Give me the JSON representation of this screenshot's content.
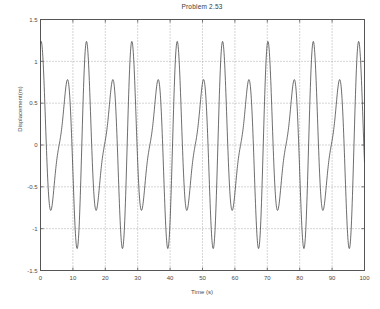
{
  "chart_data": {
    "type": "line",
    "title": "Problem 2.53",
    "xlabel": "Time (s)",
    "ylabel": "Displacement(m)",
    "xlim": [
      0,
      100
    ],
    "ylim": [
      -1.5,
      1.5
    ],
    "xticks": [
      0,
      10,
      20,
      30,
      40,
      50,
      60,
      70,
      80,
      90,
      100
    ],
    "xtick_labels": [
      "0",
      "10",
      "20",
      "30",
      "40",
      "50",
      "60",
      "70",
      "80",
      "90",
      "100"
    ],
    "yticks": [
      -1.5,
      -1,
      -0.5,
      0,
      0.5,
      1,
      1.5
    ],
    "ytick_labels": [
      "-1.5",
      "-1",
      "-0.5",
      "0",
      "0.5",
      "1",
      "1.5"
    ],
    "grid": true,
    "grid_style": "dotted",
    "line_color": "#3c3c3c",
    "background_color": "#ffffff",
    "legend": null,
    "series": [
      {
        "name": "Displacement",
        "model": "x(t) = A1*sin(w1*t) + A2*sin(w2*t)",
        "amplitude_envelope_max": 1.3,
        "amplitude_envelope_min": 0.45,
        "beat_period": 28,
        "carrier_period": 7.0,
        "x": [
          0,
          0.5,
          1,
          1.5,
          2,
          2.5,
          3,
          3.5,
          4,
          4.5,
          5,
          5.5,
          6,
          6.5,
          7,
          7.5,
          8,
          8.5,
          9,
          9.5,
          10,
          10.5,
          11,
          11.5,
          12,
          12.5,
          13,
          13.5,
          14,
          14.5,
          15,
          15.5,
          16,
          16.5,
          17,
          17.5,
          18,
          18.5,
          19,
          19.5,
          20,
          20.5,
          21,
          21.5,
          22,
          22.5,
          23,
          23.5,
          24,
          24.5,
          25,
          25.5,
          26,
          26.5,
          27,
          27.5,
          28,
          28.5,
          29,
          29.5,
          30,
          30.5,
          31,
          31.5,
          32,
          32.5,
          33,
          33.5,
          34,
          34.5,
          35,
          35.5,
          36,
          36.5,
          37,
          37.5,
          38,
          38.5,
          39,
          39.5,
          40,
          40.5,
          41,
          41.5,
          42,
          42.5,
          43,
          43.5,
          44,
          44.5,
          45,
          45.5,
          46,
          46.5,
          47,
          47.5,
          48,
          48.5,
          49,
          49.5,
          50,
          50.5,
          51,
          51.5,
          52,
          52.5,
          53,
          53.5,
          54,
          54.5,
          55,
          55.5,
          56,
          56.5,
          57,
          57.5,
          58,
          58.5,
          59,
          59.5,
          60,
          60.5,
          61,
          61.5,
          62,
          62.5,
          63,
          63.5,
          64,
          64.5,
          65,
          65.5,
          66,
          66.5,
          67,
          67.5,
          68,
          68.5,
          69,
          69.5,
          70,
          70.5,
          71,
          71.5,
          72,
          72.5,
          73,
          73.5,
          74,
          74.5,
          75,
          75.5,
          76,
          76.5,
          77,
          77.5,
          78,
          78.5,
          79,
          79.5,
          80,
          80.5,
          81,
          81.5,
          82,
          82.5,
          83,
          83.5,
          84,
          84.5,
          85,
          85.5,
          86,
          86.5,
          87,
          87.5,
          88,
          88.5,
          89,
          89.5,
          90,
          90.5,
          91,
          91.5,
          92,
          92.5,
          93,
          93.5,
          94,
          94.5,
          95,
          95.5,
          96,
          96.5,
          97,
          97.5,
          98,
          98.5,
          99,
          99.5,
          100
        ],
        "peak_times": [
          3,
          10,
          17,
          24,
          31,
          38,
          45,
          52,
          59,
          66,
          73,
          80,
          87,
          94
        ],
        "notes": "Zero-mean oscillation, peaks near +1.3 and troughs near -1.35 at beat maxima; amplitude shrinks to about 0.5 at beat nodes near t=8, 36, 64, 92."
      }
    ]
  }
}
